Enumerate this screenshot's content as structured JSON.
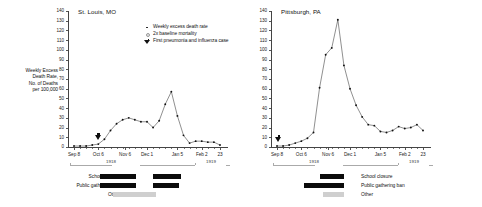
{
  "figure": {
    "ylabel": "Weekly Excess\nDeath Rate,\nNo. of Deaths\nper 100,000",
    "legend": [
      {
        "icon": "small-dot-marker",
        "label": "Weekly excess death rate"
      },
      {
        "icon": "open-circle-marker",
        "label": "2x baseline mortality"
      },
      {
        "icon": "triangle-marker",
        "label": "First pneumonia and influenza case"
      }
    ],
    "y_ticks": [
      0,
      10,
      20,
      30,
      40,
      50,
      60,
      70,
      80,
      90,
      100,
      110,
      120,
      130,
      140
    ],
    "x_ticks": [
      "Sep 8",
      "Oct 6",
      "Nov 6",
      "Dec 1",
      "Jan 5",
      "Feb 2",
      "23"
    ],
    "years": [
      "1918",
      "1919"
    ],
    "npi_rows": [
      "School closure",
      "Public gathering ban",
      "Other"
    ]
  },
  "chart_data": [
    {
      "type": "line",
      "title": "St. Louis, MO",
      "xlabel": "",
      "ylabel": "Weekly Excess Death Rate, No. of Deaths per 100,000",
      "ylim": [
        0,
        140
      ],
      "grid": false,
      "legend_position": "top-right",
      "x": [
        "Sep 8",
        "Sep 15",
        "Sep 22",
        "Sep 29",
        "Oct 6",
        "Oct 13",
        "Oct 20",
        "Oct 27",
        "Nov 3",
        "Nov 10",
        "Nov 17",
        "Nov 24",
        "Dec 1",
        "Dec 8",
        "Dec 15",
        "Dec 22",
        "Dec 29",
        "Jan 5",
        "Jan 12",
        "Jan 19",
        "Jan 26",
        "Feb 2",
        "Feb 9",
        "Feb 16",
        "Feb 23"
      ],
      "values": [
        1,
        1,
        1,
        2,
        3,
        8,
        17,
        24,
        28,
        30,
        28,
        26,
        26,
        20,
        27,
        44,
        57,
        32,
        12,
        4,
        6,
        6,
        5,
        5,
        2
      ],
      "annotations": [
        {
          "type": "first-case",
          "x": "Oct 5",
          "label": "First pneumonia and influenza case"
        }
      ],
      "interventions": [
        {
          "row": "School closure",
          "segments": [
            [
              "Oct 7",
              "Nov 14"
            ],
            [
              "Dec 4",
              "Jan 1"
            ]
          ]
        },
        {
          "row": "Public gathering ban",
          "segments": [
            [
              "Oct 7",
              "Nov 14"
            ],
            [
              "Dec 4",
              "Dec 28"
            ]
          ]
        },
        {
          "row": "Other",
          "segments": [
            [
              "Nov 14",
              "Jan 6"
            ]
          ]
        }
      ]
    },
    {
      "type": "line",
      "title": "Pittsburgh, PA",
      "xlabel": "",
      "ylabel": "Weekly Excess Death Rate, No. of Deaths per 100,000",
      "ylim": [
        0,
        140
      ],
      "grid": false,
      "legend_position": "none",
      "x": [
        "Sep 8",
        "Sep 15",
        "Sep 22",
        "Sep 29",
        "Oct 6",
        "Oct 13",
        "Oct 20",
        "Oct 27",
        "Nov 3",
        "Nov 10",
        "Nov 17",
        "Nov 24",
        "Dec 1",
        "Dec 8",
        "Dec 15",
        "Dec 22",
        "Dec 29",
        "Jan 5",
        "Jan 12",
        "Jan 19",
        "Jan 26",
        "Feb 2",
        "Feb 9",
        "Feb 16",
        "Feb 23"
      ],
      "values": [
        1,
        1,
        2,
        4,
        6,
        9,
        15,
        61,
        95,
        102,
        131,
        84,
        60,
        43,
        31,
        23,
        22,
        16,
        15,
        17,
        21,
        19,
        20,
        23,
        17
      ],
      "annotations": [
        {
          "type": "first-case",
          "x": "Sep 10",
          "label": "First pneumonia and influenza case"
        }
      ],
      "interventions": [
        {
          "row": "School closure",
          "segments": [
            [
              "Oct 24",
              "Nov 18"
            ]
          ]
        },
        {
          "row": "Public gathering ban",
          "segments": [
            [
              "Oct 10",
              "Nov 18"
            ]
          ]
        },
        {
          "row": "Other",
          "segments": [
            [
              "Oct 27",
              "Nov 18"
            ]
          ]
        }
      ]
    }
  ]
}
